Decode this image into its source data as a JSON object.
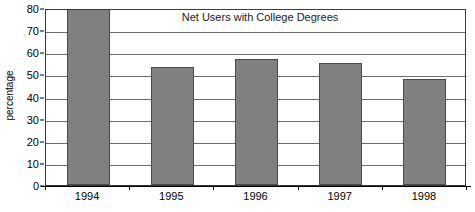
{
  "chart_data": {
    "type": "bar",
    "title": "Net Users with College Degrees",
    "xlabel": "",
    "ylabel": "percentage",
    "categories": [
      "1994",
      "1995",
      "1996",
      "1997",
      "1998"
    ],
    "values": [
      80,
      53.5,
      57,
      55,
      48
    ],
    "ylim": [
      0,
      80
    ],
    "ytick_values": [
      0,
      10,
      20,
      30,
      40,
      50,
      60,
      70,
      80
    ],
    "ytick_labels": [
      "0",
      "10",
      "20",
      "30",
      "40",
      "50",
      "60",
      "70",
      "80"
    ],
    "grid": true,
    "legend": false,
    "legend_position": "none",
    "series": [
      {
        "name": "Net Users with College Degrees",
        "values": [
          80,
          53.5,
          57,
          55,
          48
        ],
        "color": "#808080"
      }
    ],
    "colors": {
      "bar_fill": "#808080",
      "bar_border": "#4a4a4a",
      "gridline": "#6e6e6e",
      "axis": "#000000",
      "plot_border": "#3a3a3a",
      "background": "#ffffff",
      "text": "#000000"
    }
  }
}
